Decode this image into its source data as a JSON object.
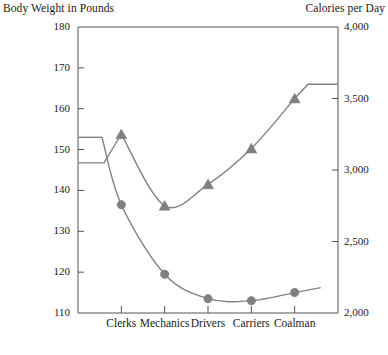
{
  "chart_data": {
    "type": "line",
    "title": "",
    "categories": [
      "Clerks",
      "Mechanics",
      "Drivers",
      "Carriers",
      "Coalman"
    ],
    "grid": false,
    "legend": "none",
    "axes": {
      "left": {
        "label": "Body Weight in Pounds",
        "ticks": [
          "180",
          "170",
          "160",
          "150",
          "140",
          "130",
          "120",
          "110"
        ],
        "tick_values": [
          180,
          170,
          160,
          150,
          140,
          130,
          120,
          110
        ],
        "ylim": [
          110,
          180
        ]
      },
      "right": {
        "label": "Calories per Day",
        "ticks": [
          "4,000",
          "3,500",
          "3,000",
          "2,500",
          "2,000"
        ],
        "tick_values": [
          4000,
          3500,
          3000,
          2500,
          2000
        ],
        "ylim": [
          2000,
          4000
        ]
      }
    },
    "series": [
      {
        "name": "Body Weight in Pounds",
        "axis": "left",
        "marker": "circle",
        "color": "#808080",
        "values": [
          136.5,
          119.5,
          113.5,
          113,
          115
        ]
      },
      {
        "name": "Calories per Day",
        "axis": "right",
        "marker": "triangle",
        "color": "#808080",
        "values": [
          3250,
          2750,
          2900,
          3150,
          3500
        ],
        "lead_in_value": 3050,
        "tail_value": 3600
      }
    ]
  }
}
